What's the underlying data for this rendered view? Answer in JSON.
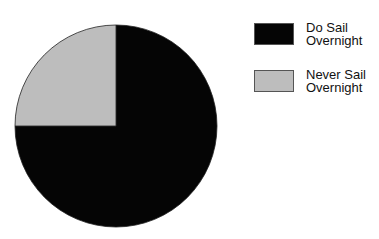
{
  "chart_data": {
    "type": "pie",
    "title": "",
    "categories": [
      "Do Sail Overnight",
      "Never Sail Overnight"
    ],
    "values": [
      75,
      25
    ],
    "unit": "percent",
    "colors": [
      "#050505",
      "#bdbdbd"
    ],
    "start_angle": "12 o'clock, Never Sail slice spans 9 to 12 o'clock",
    "legend_position": "right"
  },
  "legend": {
    "items": [
      {
        "line1": "Do Sail",
        "line2": "Overnight",
        "color": "#050505"
      },
      {
        "line1": "Never Sail",
        "line2": "Overnight",
        "color": "#bdbdbd"
      }
    ]
  }
}
